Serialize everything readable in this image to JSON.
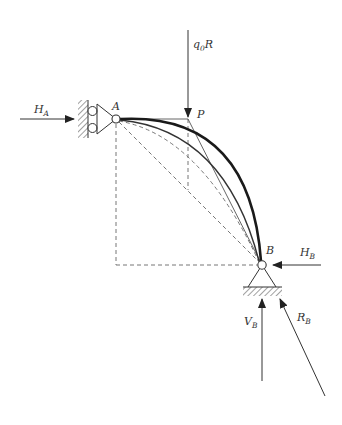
{
  "diagram": {
    "type": "structural-arch-free-body-diagram",
    "labels": {
      "load": {
        "main": "q",
        "sub": "0",
        "tail": "R"
      },
      "point_a": "A",
      "point_p": "P",
      "point_b": "B",
      "h_a": {
        "main": "H",
        "sub": "A"
      },
      "h_b": {
        "main": "H",
        "sub": "B"
      },
      "v_b": {
        "main": "V",
        "sub": "B"
      },
      "r_b": {
        "main": "R",
        "sub": "B"
      }
    },
    "colors": {
      "stroke": "#333333",
      "thick_curve": "#1a1a1a",
      "dashed": "#777777",
      "background": "#ffffff"
    },
    "supports": {
      "a": "roller-wall-support",
      "b": "pin-ground-support"
    }
  }
}
